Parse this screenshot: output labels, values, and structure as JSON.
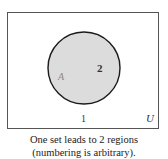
{
  "diagram": {
    "type": "venn",
    "universe_label": "U",
    "sets": [
      {
        "label": "A",
        "region_label": "2"
      }
    ],
    "outside_region_label": "1",
    "colors": {
      "set_fill": "#dcdcdc",
      "stroke": "#1a1a1a",
      "frame": "#555555",
      "background": "#ffffff"
    }
  },
  "caption": {
    "line1": "One set leads to 2 regions",
    "line2": "(numbering is arbitrary)."
  }
}
